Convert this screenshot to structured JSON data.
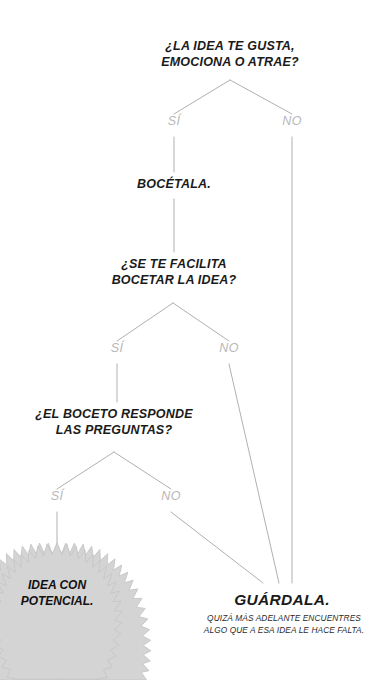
{
  "diagram": {
    "title_node": "¿LA IDEA TE GUSTA,\nEMOCIONA O ATRAE?",
    "language": "es",
    "colors": {
      "text": "#1a1a1a",
      "edge_line": "#b0b0b0",
      "edge_label": "#b8b8b8",
      "badge_fill": "#d4d4d4",
      "badge_stroke": "#c6c6c6",
      "background": "#ffffff"
    },
    "nodes": [
      {
        "id": "q1",
        "type": "question",
        "text": "¿LA IDEA TE GUSTA,\nEMOCIONA O ATRAE?"
      },
      {
        "id": "a1",
        "type": "action",
        "text": "BOCÉTALA."
      },
      {
        "id": "q2",
        "type": "question",
        "text": "¿SE TE FACILITA\nBOCETAR LA IDEA?"
      },
      {
        "id": "q3",
        "type": "question",
        "text": "¿EL BOCETO RESPONDE\nLAS PREGUNTAS?"
      },
      {
        "id": "end_good",
        "type": "badge",
        "text": "IDEA CON\nPOTENCIAL."
      },
      {
        "id": "end_save",
        "type": "terminal",
        "text": "GUÁRDALA.",
        "subtitle": "QUIZÁ MÁS ADELANTE ENCUENTRES\nALGO QUE A ESA IDEA LE HACE FALTA."
      }
    ],
    "edge_labels": {
      "q1_yes": "SÍ",
      "q1_no": "NO",
      "q2_yes": "SÍ",
      "q2_no": "NO",
      "q3_yes": "SÍ",
      "q3_no": "NO"
    }
  }
}
